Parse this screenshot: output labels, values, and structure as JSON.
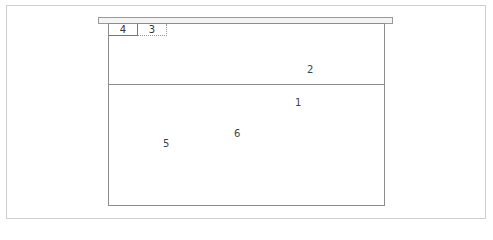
{
  "diagram": {
    "tabs": [
      {
        "label": "4",
        "style": "solid"
      },
      {
        "label": "3",
        "style": "dotted"
      }
    ],
    "labels": {
      "upper_region": "2",
      "lower_region_top": "1",
      "lower_left": "5",
      "lower_center": "6"
    },
    "colors": {
      "border": "#8c8c8c",
      "frame": "#cfcfcf",
      "shelf_fill": "#f4f4f4"
    }
  }
}
